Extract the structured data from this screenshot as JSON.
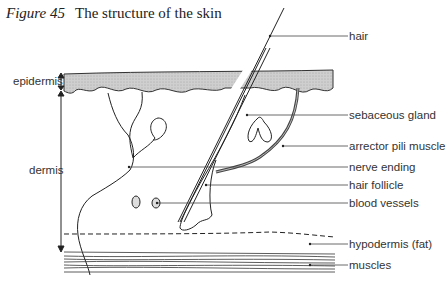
{
  "caption": {
    "figure_label": "Figure 45",
    "title": "The structure of the skin"
  },
  "layers": {
    "epidermis": "epidermis",
    "dermis": "dermis"
  },
  "labels": {
    "hair": "hair",
    "sebaceous_gland": "sebaceous gland",
    "arrector_pili_muscle": "arrector pili muscle",
    "nerve_ending": "nerve ending",
    "hair_follicle": "hair follicle",
    "blood_vessels": "blood vessels",
    "hypodermis": "hypodermis (fat)",
    "muscles": "muscles"
  },
  "colors": {
    "epidermis_fill": "#c8c8c8",
    "line": "#222222",
    "text": "#333333"
  }
}
